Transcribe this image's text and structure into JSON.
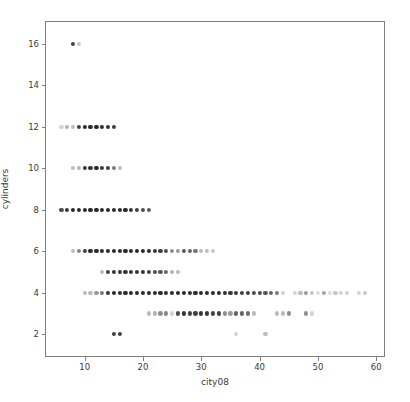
{
  "chart_data": {
    "type": "scatter",
    "title": "",
    "xlabel": "city08",
    "ylabel": "cylinders",
    "xlim": [
      3.2,
      61.5
    ],
    "ylim": [
      0.9,
      17.1
    ],
    "xticks": [
      10,
      20,
      30,
      40,
      50,
      60
    ],
    "yticks": [
      2,
      4,
      6,
      8,
      10,
      12,
      14,
      16
    ],
    "xtick_labels": [
      "10",
      "20",
      "30",
      "40",
      "50",
      "60"
    ],
    "ytick_labels": [
      "2",
      "4",
      "6",
      "8",
      "10",
      "12",
      "14",
      "16"
    ],
    "grid": false,
    "legend": null,
    "marker": "circle",
    "marker_size_px": 4.2,
    "point_color": "#1f1f1f",
    "axis_color": "#7f7f7f",
    "background_color": "#ffffff",
    "note": "Alpha of each marker encodes overplotting density; x=city08 mpg, y=engine cylinder count",
    "points": [
      {
        "x": 8,
        "y": 16,
        "alpha": 0.85
      },
      {
        "x": 9,
        "y": 16,
        "alpha": 0.25
      },
      {
        "x": 6,
        "y": 12,
        "alpha": 0.2
      },
      {
        "x": 7,
        "y": 12,
        "alpha": 0.35
      },
      {
        "x": 8,
        "y": 12,
        "alpha": 0.3
      },
      {
        "x": 9,
        "y": 12,
        "alpha": 0.85
      },
      {
        "x": 10,
        "y": 12,
        "alpha": 0.95
      },
      {
        "x": 11,
        "y": 12,
        "alpha": 0.95
      },
      {
        "x": 12,
        "y": 12,
        "alpha": 0.95
      },
      {
        "x": 13,
        "y": 12,
        "alpha": 0.95
      },
      {
        "x": 14,
        "y": 12,
        "alpha": 0.9
      },
      {
        "x": 15,
        "y": 12,
        "alpha": 0.85
      },
      {
        "x": 8,
        "y": 10,
        "alpha": 0.3
      },
      {
        "x": 9,
        "y": 10,
        "alpha": 0.35
      },
      {
        "x": 10,
        "y": 10,
        "alpha": 0.9
      },
      {
        "x": 11,
        "y": 10,
        "alpha": 0.9
      },
      {
        "x": 12,
        "y": 10,
        "alpha": 0.95
      },
      {
        "x": 13,
        "y": 10,
        "alpha": 0.9
      },
      {
        "x": 14,
        "y": 10,
        "alpha": 0.85
      },
      {
        "x": 15,
        "y": 10,
        "alpha": 0.6
      },
      {
        "x": 16,
        "y": 10,
        "alpha": 0.3
      },
      {
        "x": 6,
        "y": 8,
        "alpha": 0.8
      },
      {
        "x": 7,
        "y": 8,
        "alpha": 0.9
      },
      {
        "x": 8,
        "y": 8,
        "alpha": 0.95
      },
      {
        "x": 9,
        "y": 8,
        "alpha": 0.95
      },
      {
        "x": 10,
        "y": 8,
        "alpha": 0.95
      },
      {
        "x": 11,
        "y": 8,
        "alpha": 0.95
      },
      {
        "x": 12,
        "y": 8,
        "alpha": 0.95
      },
      {
        "x": 13,
        "y": 8,
        "alpha": 0.95
      },
      {
        "x": 14,
        "y": 8,
        "alpha": 0.95
      },
      {
        "x": 15,
        "y": 8,
        "alpha": 0.95
      },
      {
        "x": 16,
        "y": 8,
        "alpha": 0.95
      },
      {
        "x": 17,
        "y": 8,
        "alpha": 0.95
      },
      {
        "x": 18,
        "y": 8,
        "alpha": 0.9
      },
      {
        "x": 19,
        "y": 8,
        "alpha": 0.85
      },
      {
        "x": 20,
        "y": 8,
        "alpha": 0.8
      },
      {
        "x": 21,
        "y": 8,
        "alpha": 0.75
      },
      {
        "x": 8,
        "y": 6,
        "alpha": 0.3
      },
      {
        "x": 9,
        "y": 6,
        "alpha": 0.55
      },
      {
        "x": 10,
        "y": 6,
        "alpha": 0.85
      },
      {
        "x": 11,
        "y": 6,
        "alpha": 0.95
      },
      {
        "x": 12,
        "y": 6,
        "alpha": 0.95
      },
      {
        "x": 13,
        "y": 6,
        "alpha": 0.95
      },
      {
        "x": 14,
        "y": 6,
        "alpha": 0.95
      },
      {
        "x": 15,
        "y": 6,
        "alpha": 0.95
      },
      {
        "x": 16,
        "y": 6,
        "alpha": 0.95
      },
      {
        "x": 17,
        "y": 6,
        "alpha": 0.95
      },
      {
        "x": 18,
        "y": 6,
        "alpha": 0.95
      },
      {
        "x": 19,
        "y": 6,
        "alpha": 0.95
      },
      {
        "x": 20,
        "y": 6,
        "alpha": 0.95
      },
      {
        "x": 21,
        "y": 6,
        "alpha": 0.95
      },
      {
        "x": 22,
        "y": 6,
        "alpha": 0.9
      },
      {
        "x": 23,
        "y": 6,
        "alpha": 0.85
      },
      {
        "x": 24,
        "y": 6,
        "alpha": 0.8
      },
      {
        "x": 25,
        "y": 6,
        "alpha": 0.5
      },
      {
        "x": 26,
        "y": 6,
        "alpha": 0.45
      },
      {
        "x": 27,
        "y": 6,
        "alpha": 0.75
      },
      {
        "x": 28,
        "y": 6,
        "alpha": 0.7
      },
      {
        "x": 29,
        "y": 6,
        "alpha": 0.6
      },
      {
        "x": 30,
        "y": 6,
        "alpha": 0.3
      },
      {
        "x": 31,
        "y": 6,
        "alpha": 0.3
      },
      {
        "x": 32,
        "y": 6,
        "alpha": 0.25
      },
      {
        "x": 13,
        "y": 5,
        "alpha": 0.3
      },
      {
        "x": 14,
        "y": 5,
        "alpha": 0.85
      },
      {
        "x": 15,
        "y": 5,
        "alpha": 0.9
      },
      {
        "x": 16,
        "y": 5,
        "alpha": 0.9
      },
      {
        "x": 17,
        "y": 5,
        "alpha": 0.9
      },
      {
        "x": 18,
        "y": 5,
        "alpha": 0.9
      },
      {
        "x": 19,
        "y": 5,
        "alpha": 0.9
      },
      {
        "x": 20,
        "y": 5,
        "alpha": 0.9
      },
      {
        "x": 21,
        "y": 5,
        "alpha": 0.85
      },
      {
        "x": 22,
        "y": 5,
        "alpha": 0.8
      },
      {
        "x": 23,
        "y": 5,
        "alpha": 0.75
      },
      {
        "x": 24,
        "y": 5,
        "alpha": 0.7
      },
      {
        "x": 25,
        "y": 5,
        "alpha": 0.35
      },
      {
        "x": 26,
        "y": 5,
        "alpha": 0.3
      },
      {
        "x": 10,
        "y": 4,
        "alpha": 0.3
      },
      {
        "x": 11,
        "y": 4,
        "alpha": 0.3
      },
      {
        "x": 12,
        "y": 4,
        "alpha": 0.45
      },
      {
        "x": 13,
        "y": 4,
        "alpha": 0.6
      },
      {
        "x": 14,
        "y": 4,
        "alpha": 0.9
      },
      {
        "x": 15,
        "y": 4,
        "alpha": 0.95
      },
      {
        "x": 16,
        "y": 4,
        "alpha": 0.95
      },
      {
        "x": 17,
        "y": 4,
        "alpha": 0.95
      },
      {
        "x": 18,
        "y": 4,
        "alpha": 0.95
      },
      {
        "x": 19,
        "y": 4,
        "alpha": 0.95
      },
      {
        "x": 20,
        "y": 4,
        "alpha": 0.95
      },
      {
        "x": 21,
        "y": 4,
        "alpha": 0.95
      },
      {
        "x": 22,
        "y": 4,
        "alpha": 0.95
      },
      {
        "x": 23,
        "y": 4,
        "alpha": 0.95
      },
      {
        "x": 24,
        "y": 4,
        "alpha": 0.95
      },
      {
        "x": 25,
        "y": 4,
        "alpha": 0.95
      },
      {
        "x": 26,
        "y": 4,
        "alpha": 0.95
      },
      {
        "x": 27,
        "y": 4,
        "alpha": 0.95
      },
      {
        "x": 28,
        "y": 4,
        "alpha": 0.95
      },
      {
        "x": 29,
        "y": 4,
        "alpha": 0.95
      },
      {
        "x": 30,
        "y": 4,
        "alpha": 0.95
      },
      {
        "x": 31,
        "y": 4,
        "alpha": 0.95
      },
      {
        "x": 32,
        "y": 4,
        "alpha": 0.95
      },
      {
        "x": 33,
        "y": 4,
        "alpha": 0.95
      },
      {
        "x": 34,
        "y": 4,
        "alpha": 0.95
      },
      {
        "x": 35,
        "y": 4,
        "alpha": 0.9
      },
      {
        "x": 36,
        "y": 4,
        "alpha": 0.9
      },
      {
        "x": 37,
        "y": 4,
        "alpha": 0.85
      },
      {
        "x": 38,
        "y": 4,
        "alpha": 0.85
      },
      {
        "x": 39,
        "y": 4,
        "alpha": 0.8
      },
      {
        "x": 40,
        "y": 4,
        "alpha": 0.8
      },
      {
        "x": 41,
        "y": 4,
        "alpha": 0.75
      },
      {
        "x": 42,
        "y": 4,
        "alpha": 0.7
      },
      {
        "x": 43,
        "y": 4,
        "alpha": 0.6
      },
      {
        "x": 44,
        "y": 4,
        "alpha": 0.2
      },
      {
        "x": 46,
        "y": 4,
        "alpha": 0.2
      },
      {
        "x": 47,
        "y": 4,
        "alpha": 0.3
      },
      {
        "x": 48,
        "y": 4,
        "alpha": 0.45
      },
      {
        "x": 49,
        "y": 4,
        "alpha": 0.25
      },
      {
        "x": 50,
        "y": 4,
        "alpha": 0.15
      },
      {
        "x": 51,
        "y": 4,
        "alpha": 0.4
      },
      {
        "x": 52,
        "y": 4,
        "alpha": 0.15
      },
      {
        "x": 53,
        "y": 4,
        "alpha": 0.25
      },
      {
        "x": 54,
        "y": 4,
        "alpha": 0.2
      },
      {
        "x": 55,
        "y": 4,
        "alpha": 0.2
      },
      {
        "x": 57,
        "y": 4,
        "alpha": 0.2
      },
      {
        "x": 58,
        "y": 4,
        "alpha": 0.25
      },
      {
        "x": 21,
        "y": 3,
        "alpha": 0.3
      },
      {
        "x": 22,
        "y": 3,
        "alpha": 0.35
      },
      {
        "x": 23,
        "y": 3,
        "alpha": 0.5
      },
      {
        "x": 24,
        "y": 3,
        "alpha": 0.55
      },
      {
        "x": 25,
        "y": 3,
        "alpha": 0.2
      },
      {
        "x": 26,
        "y": 3,
        "alpha": 0.8
      },
      {
        "x": 27,
        "y": 3,
        "alpha": 0.9
      },
      {
        "x": 28,
        "y": 3,
        "alpha": 0.85
      },
      {
        "x": 29,
        "y": 3,
        "alpha": 0.85
      },
      {
        "x": 30,
        "y": 3,
        "alpha": 0.9
      },
      {
        "x": 31,
        "y": 3,
        "alpha": 0.9
      },
      {
        "x": 32,
        "y": 3,
        "alpha": 0.85
      },
      {
        "x": 33,
        "y": 3,
        "alpha": 0.85
      },
      {
        "x": 34,
        "y": 3,
        "alpha": 0.5
      },
      {
        "x": 35,
        "y": 3,
        "alpha": 0.45
      },
      {
        "x": 36,
        "y": 3,
        "alpha": 0.7
      },
      {
        "x": 37,
        "y": 3,
        "alpha": 0.7
      },
      {
        "x": 38,
        "y": 3,
        "alpha": 0.65
      },
      {
        "x": 39,
        "y": 3,
        "alpha": 0.3
      },
      {
        "x": 43,
        "y": 3,
        "alpha": 0.3
      },
      {
        "x": 44,
        "y": 3,
        "alpha": 0.3
      },
      {
        "x": 45,
        "y": 3,
        "alpha": 0.5
      },
      {
        "x": 48,
        "y": 3,
        "alpha": 0.5
      },
      {
        "x": 49,
        "y": 3,
        "alpha": 0.2
      },
      {
        "x": 15,
        "y": 2,
        "alpha": 0.85
      },
      {
        "x": 16,
        "y": 2,
        "alpha": 0.85
      },
      {
        "x": 36,
        "y": 2,
        "alpha": 0.2
      },
      {
        "x": 41,
        "y": 2,
        "alpha": 0.3
      }
    ]
  },
  "figure": {
    "plot_left_px": 45,
    "plot_top_px": 21,
    "plot_width_px": 340,
    "plot_height_px": 336
  }
}
